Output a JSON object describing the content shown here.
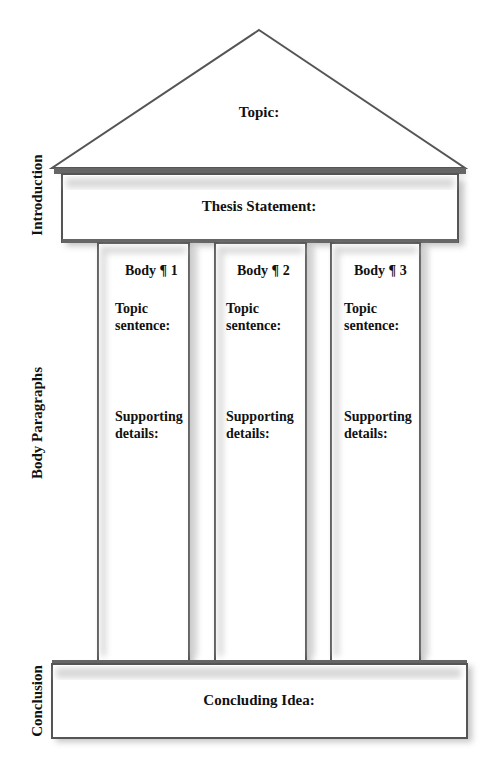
{
  "side_labels": {
    "introduction": "Introduction",
    "body": "Body Paragraphs",
    "conclusion": "Conclusion"
  },
  "pediment": {
    "label": "Topic:"
  },
  "entablature": {
    "label": "Thesis Statement:"
  },
  "columns": [
    {
      "title": "Body ¶ 1",
      "topic_line1": "Topic",
      "topic_line2": "sentence:",
      "support_line1": "Supporting",
      "support_line2": "details:"
    },
    {
      "title": "Body ¶ 2",
      "topic_line1": "Topic",
      "topic_line2": "sentence:",
      "support_line1": "Supporting",
      "support_line2": "details:"
    },
    {
      "title": "Body ¶ 3",
      "topic_line1": "Topic",
      "topic_line2": "sentence:",
      "support_line1": "Supporting",
      "support_line2": "details:"
    }
  ],
  "base": {
    "label": "Concluding Idea:"
  },
  "colors": {
    "stroke": "#555555",
    "shadow": "#9a9a9a",
    "text": "#111111"
  }
}
